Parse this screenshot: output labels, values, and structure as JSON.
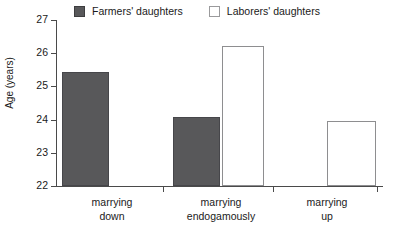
{
  "legend": {
    "position": "top-center",
    "entries": [
      {
        "label": "Farmers' daughters",
        "swatch": "filled-square-icon",
        "color": "#58585a"
      },
      {
        "label": "Laborers' daughters",
        "swatch": "hollow-square-icon",
        "color": "#ffffff"
      }
    ]
  },
  "axes": {
    "y_title": "Age (years)",
    "y_ticks": [
      "22",
      "23",
      "24",
      "25",
      "26",
      "27"
    ],
    "x_title": ""
  },
  "chart_data": {
    "type": "bar",
    "title": "",
    "subtitle": "",
    "xlabel": "",
    "ylabel": "Age (years)",
    "ylim": [
      22,
      27
    ],
    "ytick_values": [
      22,
      23,
      24,
      25,
      26,
      27
    ],
    "ytick_labels": [
      "22",
      "23",
      "24",
      "25",
      "26",
      "27"
    ],
    "grid": false,
    "legend_position": "top-center",
    "categories": [
      "marrying down",
      "marrying endogamously",
      "marrying up"
    ],
    "category_lines": [
      [
        "marrying",
        "down"
      ],
      [
        "marrying",
        "endogamously"
      ],
      [
        "marrying",
        "up"
      ]
    ],
    "series": [
      {
        "name": "Farmers' daughters",
        "color": "#58585a",
        "style": "filled",
        "values": [
          25.43,
          24.08,
          null
        ]
      },
      {
        "name": "Laborers' daughters",
        "color": "#ffffff",
        "style": "hollow",
        "values": [
          null,
          26.22,
          23.95
        ]
      }
    ],
    "annotations": []
  },
  "bars": [
    {
      "name": "bar-farmers-marrying-down",
      "series": "Farmers' daughters",
      "category": "marrying down",
      "value": 25.43,
      "style": "farmers",
      "left": 6,
      "width": 47
    },
    {
      "name": "bar-farmers-marrying-endogamously",
      "series": "Farmers' daughters",
      "category": "marrying endogamously",
      "value": 24.08,
      "style": "farmers",
      "left": 117,
      "width": 47
    },
    {
      "name": "bar-laborers-marrying-endogamously",
      "series": "Laborers' daughters",
      "category": "marrying endogamously",
      "value": 26.22,
      "style": "laborers",
      "left": 166,
      "width": 42
    },
    {
      "name": "bar-laborers-marrying-up",
      "series": "Laborers' daughters",
      "category": "marrying up",
      "value": 23.95,
      "style": "laborers",
      "left": 271,
      "width": 49
    }
  ]
}
